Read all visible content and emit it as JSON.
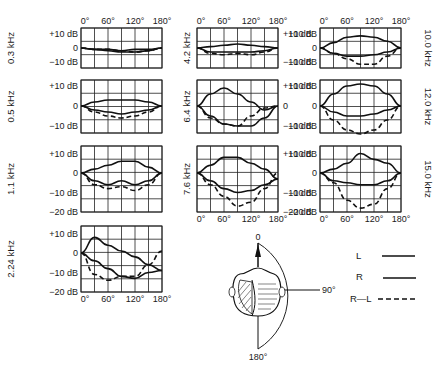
{
  "chart_data": {
    "type": "line",
    "title": "",
    "xlabel": "Azimuth angle",
    "ylabel": "Level (dB)",
    "x": [
      0,
      30,
      60,
      90,
      120,
      150,
      180
    ],
    "x_tick_labels": [
      "0°",
      "60°",
      "120°",
      "180°"
    ],
    "legend": [
      {
        "name": "L",
        "style": "solid"
      },
      {
        "name": "R",
        "style": "solid"
      },
      {
        "name": "R—L",
        "style": "dashed"
      }
    ],
    "panels": [
      {
        "freq": "0.3 kHz",
        "ylim": [
          -12,
          12
        ],
        "y_ticks": [
          "+10 dB",
          "0",
          "−10 dB"
        ],
        "series": [
          {
            "name": "L",
            "values": [
              0,
              -1,
              -2,
              -3,
              -3,
              -2,
              0
            ]
          },
          {
            "name": "R",
            "values": [
              0,
              -1,
              -1,
              -2,
              -1,
              -1,
              0
            ]
          },
          {
            "name": "R—L",
            "values": [
              0,
              -1,
              -1,
              -2,
              -3,
              -2,
              0
            ]
          }
        ]
      },
      {
        "freq": "0.5 kHz",
        "ylim": [
          -15,
          15
        ],
        "y_ticks": [
          "+10 dB",
          "0",
          "−10 dB"
        ],
        "series": [
          {
            "name": "L",
            "values": [
              0,
              2,
              3,
              3,
              3,
              2,
              0
            ]
          },
          {
            "name": "R",
            "values": [
              0,
              -2,
              -3,
              -4,
              -3,
              -2,
              0
            ]
          },
          {
            "name": "R—L",
            "values": [
              0,
              -3,
              -5,
              -6,
              -5,
              -3,
              0
            ]
          }
        ]
      },
      {
        "freq": "1.1 kHz",
        "ylim": [
          -20,
          13
        ],
        "y_ticks": [
          "+10 dB",
          "0",
          "−10 dB",
          "−20 dB"
        ],
        "series": [
          {
            "name": "L",
            "values": [
              0,
              2,
              4,
              6,
              6,
              3,
              0
            ]
          },
          {
            "name": "R",
            "values": [
              0,
              -4,
              -6,
              -4,
              -6,
              -4,
              0
            ]
          },
          {
            "name": "R—L",
            "values": [
              0,
              -6,
              -8,
              -7,
              -9,
              -6,
              0
            ]
          }
        ]
      },
      {
        "freq": "2.24 kHz",
        "ylim": [
          -20,
          13
        ],
        "y_ticks": [
          "+10 dB",
          "0",
          "−10 dB",
          "−20 dB"
        ],
        "series": [
          {
            "name": "L",
            "values": [
              0,
              8,
              4,
              1,
              -2,
              -6,
              -9
            ]
          },
          {
            "name": "R",
            "values": [
              0,
              -4,
              -8,
              -12,
              -13,
              -10,
              -9
            ]
          },
          {
            "name": "R—L",
            "values": [
              0,
              -11,
              -14,
              -12,
              -12,
              -6,
              1
            ]
          }
        ]
      },
      {
        "freq": "4.2 kHz",
        "ylim": [
          -12,
          12
        ],
        "y_ticks": [
          "+10 dB",
          "−10 dB"
        ],
        "series": [
          {
            "name": "L",
            "values": [
              0,
              1,
              2,
              3,
              2,
              1,
              0
            ]
          },
          {
            "name": "R",
            "values": [
              0,
              -3,
              -3,
              -3,
              -3,
              -2,
              0
            ]
          },
          {
            "name": "R—L",
            "values": [
              0,
              -4,
              -5,
              -4,
              -5,
              -3,
              0
            ]
          }
        ]
      },
      {
        "freq": "6.4 kHz",
        "ylim": [
          -15,
          15
        ],
        "y_ticks": [
          "+10 dB",
          "0",
          "−10 dB"
        ],
        "series": [
          {
            "name": "L",
            "values": [
              0,
              6,
              9,
              6,
              2,
              -2,
              0
            ]
          },
          {
            "name": "R",
            "values": [
              0,
              -5,
              -9,
              -10,
              -10,
              -6,
              0
            ]
          },
          {
            "name": "R—L",
            "values": [
              0,
              -6,
              -9,
              -10,
              -5,
              -1,
              0
            ]
          }
        ]
      },
      {
        "freq": "7.6 kHz",
        "ylim": [
          -20,
          13
        ],
        "y_ticks": [
          "+10 dB",
          "−10 dB",
          "−20 dB"
        ],
        "series": [
          {
            "name": "L",
            "values": [
              0,
              4,
              8,
              8,
              5,
              2,
              -3
            ]
          },
          {
            "name": "R",
            "values": [
              0,
              -4,
              -8,
              -10,
              -9,
              -6,
              -3
            ]
          },
          {
            "name": "R—L",
            "values": [
              0,
              -6,
              -12,
              -17,
              -15,
              -8,
              0
            ]
          }
        ]
      },
      {
        "freq": "10.0 kHz",
        "ylim": [
          -12,
          12
        ],
        "y_ticks": [
          "+10 dB",
          "0",
          "−10 dB"
        ],
        "series": [
          {
            "name": "L",
            "values": [
              0,
              4,
              8,
              9,
              8,
              5,
              0
            ]
          },
          {
            "name": "R",
            "values": [
              0,
              -4,
              -6,
              -6,
              -5,
              -3,
              0
            ]
          },
          {
            "name": "R—L",
            "values": [
              0,
              -4,
              -8,
              -12,
              -12,
              -6,
              0
            ]
          }
        ]
      },
      {
        "freq": "12.0 kHz",
        "ylim": [
          -15,
          15
        ],
        "y_ticks": [
          "+10 dB",
          "0",
          "−10 dB"
        ],
        "series": [
          {
            "name": "L",
            "values": [
              0,
              6,
              10,
              11,
              10,
              6,
              0
            ]
          },
          {
            "name": "R",
            "values": [
              0,
              -3,
              -5,
              -5,
              -4,
              -2,
              0
            ]
          },
          {
            "name": "R—L",
            "values": [
              0,
              -7,
              -12,
              -14,
              -12,
              -7,
              0
            ]
          }
        ]
      },
      {
        "freq": "15.0 kHz",
        "ylim": [
          -20,
          13
        ],
        "y_ticks": [
          "+10 dB",
          "0",
          "−10 dB",
          "−20 dB"
        ],
        "series": [
          {
            "name": "L",
            "values": [
              0,
              2,
              5,
              10,
              7,
              5,
              0
            ]
          },
          {
            "name": "R",
            "values": [
              0,
              -4,
              -5,
              -6,
              -6,
              -4,
              0
            ]
          },
          {
            "name": "R—L",
            "values": [
              0,
              -5,
              -14,
              -18,
              -16,
              -8,
              0
            ]
          }
        ]
      }
    ],
    "head_diagram": {
      "labels": [
        "0",
        "90°",
        "180°"
      ]
    },
    "grid": true,
    "legend_position": "bottom-right"
  },
  "labels": {
    "zero": "0",
    "deg90": "90°",
    "deg180": "180°",
    "legend_L": "L",
    "legend_R": "R",
    "legend_RL": "R—L"
  }
}
